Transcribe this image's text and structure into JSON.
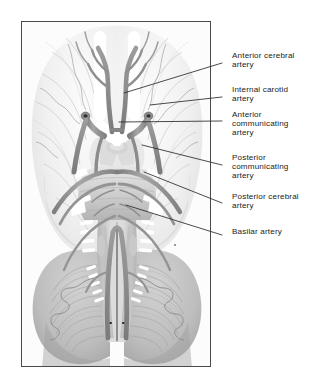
{
  "figure": {
    "kind": "anatomical-illustration",
    "view": "inferior (ventral) view of the brain"
  },
  "frame": {
    "border_color": "#4a4a4a",
    "plate_background": "#fbfbfb",
    "x": 21,
    "y": 21,
    "width": 190,
    "height": 346
  },
  "palette": {
    "page_background": "#ffffff",
    "artery_fill": "#9a9a9a",
    "artery_fill_dark": "#6f6f6f",
    "artery_outline": "#5e5e5e",
    "brain_light": "#f2f2f2",
    "brain_mid": "#d8d8d8",
    "brain_dark": "#a8a8a8",
    "cerebellum": "#b9b9b9",
    "nerve_white": "#ffffff",
    "label_text": "#1b1b1b",
    "leader_line": "#2b2b2b"
  },
  "labels": [
    {
      "id": "anterior-cerebral-artery",
      "text": "Anterior cerebral\nartery",
      "text_x": 232,
      "text_y": 56,
      "leader": {
        "x1": 222,
        "y1": 63,
        "x2": 124,
        "y2": 93
      }
    },
    {
      "id": "internal-carotid-artery",
      "text": "Internal carotid\nartery",
      "text_x": 232,
      "text_y": 90,
      "leader": {
        "x1": 222,
        "y1": 97,
        "x2": 150,
        "y2": 105
      }
    },
    {
      "id": "anterior-communicating-artery",
      "text": "Anterior\ncommunicating\nartery",
      "text_x": 232,
      "text_y": 115,
      "leader": {
        "x1": 222,
        "y1": 121,
        "x2": 119,
        "y2": 122
      }
    },
    {
      "id": "posterior-communicating-artery",
      "text": "Posterior\ncommunicating\nartery",
      "text_x": 232,
      "text_y": 158,
      "leader": {
        "x1": 222,
        "y1": 165,
        "x2": 142,
        "y2": 145
      }
    },
    {
      "id": "posterior-cerebral-artery",
      "text": "Posterior cerebral\nartery",
      "text_x": 232,
      "text_y": 197,
      "leader": {
        "x1": 222,
        "y1": 203,
        "x2": 144,
        "y2": 172
      }
    },
    {
      "id": "basilar-artery",
      "text": "Basilar artery",
      "text_x": 232,
      "text_y": 231,
      "leader": {
        "x1": 222,
        "y1": 235,
        "x2": 126,
        "y2": 205
      }
    }
  ],
  "structures": {
    "olfactory_tracts": "paired white elongated bands flanking the midline anteriorly",
    "optic_chiasm": "white X-shaped structure below the anterior communicating artery",
    "pons": "broad transverse midbrain bulge at mid-plate",
    "cerebellum": "paired concentric-folia hemispheres occupying the lower third",
    "medulla": "midline column descending to the plate's lower margin",
    "cranial_nerve_rootlets": "small white slips emerging laterally from the brainstem"
  }
}
